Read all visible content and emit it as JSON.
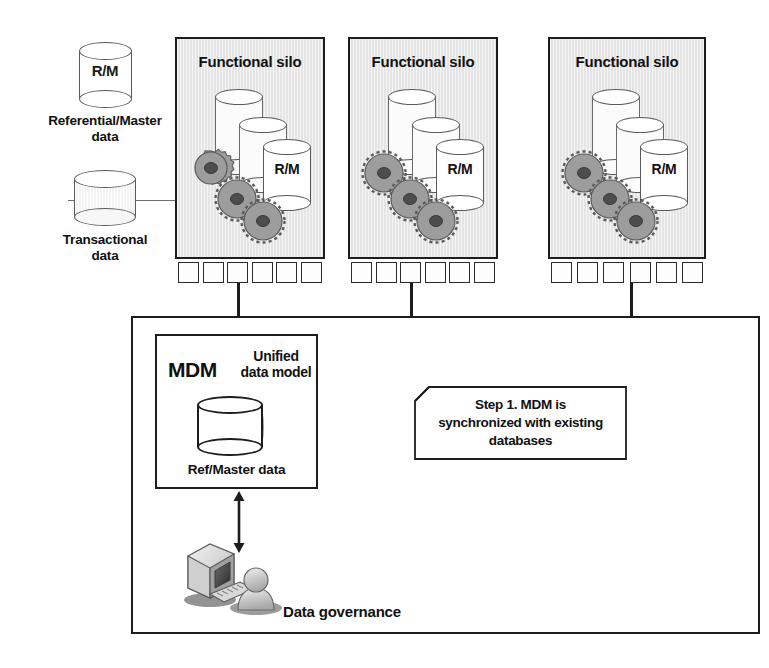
{
  "diagram": {
    "colors": {
      "ink": "#1d1d1d",
      "silo_fill": "#e9e9e9",
      "gear_fill": "#9a9a9a",
      "cylinder_outline": "#5a5a5a",
      "background": "#ffffff"
    }
  },
  "legend": {
    "items": [
      {
        "icon": "cylinder-icon",
        "icon_label": "R/M",
        "label": "Referential/Master\ndata"
      },
      {
        "icon": "cylinder-icon",
        "icon_label": "",
        "label": "Transactional\ndata"
      }
    ],
    "divider": true
  },
  "silos": [
    {
      "title": "Functional silo",
      "databases": [
        {
          "label": ""
        },
        {
          "label": ""
        },
        {
          "label": "R/M"
        }
      ],
      "gears": 3,
      "connector_tabs": 6,
      "drop_line_from_tab": 3
    },
    {
      "title": "Functional silo",
      "databases": [
        {
          "label": ""
        },
        {
          "label": ""
        },
        {
          "label": "R/M"
        }
      ],
      "gears": 3,
      "connector_tabs": 6,
      "drop_line_from_tab": 3
    },
    {
      "title": "Functional silo",
      "databases": [
        {
          "label": ""
        },
        {
          "label": ""
        },
        {
          "label": "R/M"
        }
      ],
      "gears": 3,
      "connector_tabs": 6,
      "drop_line_from_tab": 4
    }
  ],
  "governance": {
    "label": "Data governance",
    "mdm": {
      "title": "MDM",
      "subtitle": "Unified\ndata model",
      "cylinder_caption": "Ref/Master data"
    },
    "callout": {
      "text": "Step 1. MDM is\nsynchronized with existing\ndatabases",
      "corner": "folded-top-left"
    },
    "actor": {
      "computer_icon": "desktop-computer-icon",
      "person_icon": "person-icon"
    },
    "arrow": "double-headed-vertical-arrow"
  }
}
